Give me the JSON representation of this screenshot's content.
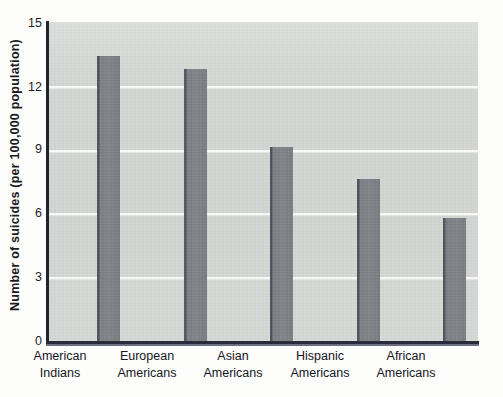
{
  "chart_data": {
    "type": "bar",
    "title": "",
    "xlabel": "",
    "ylabel": "Number of suicides (per 100,000 population)",
    "categories": [
      "American Indians",
      "European Americans",
      "Asian Americans",
      "Hispanic Americans",
      "African Americans"
    ],
    "category_lines": [
      [
        "American",
        "Indians"
      ],
      [
        "European",
        "Americans"
      ],
      [
        "Asian",
        "Americans"
      ],
      [
        "Hispanic",
        "Americans"
      ],
      [
        "African",
        "Americans"
      ]
    ],
    "values": [
      13.4,
      12.8,
      9.1,
      7.6,
      5.8
    ],
    "ylim": [
      0,
      15
    ],
    "yticks": [
      0,
      3,
      6,
      9,
      12,
      15
    ],
    "ytick_labels": [
      "0",
      "3",
      "6",
      "9",
      "12",
      "15"
    ],
    "grid": true,
    "gridlines_at": [
      3,
      6,
      9,
      12
    ],
    "legend": null,
    "colors": {
      "bar_fill": "#7a7d82",
      "bar_edge": "#4d5058",
      "plot_background": "#d4d6d4",
      "gridline": "#ffffff",
      "axis": "#23232e",
      "text": "#16161d",
      "page_background": "#fdfdfc"
    }
  }
}
